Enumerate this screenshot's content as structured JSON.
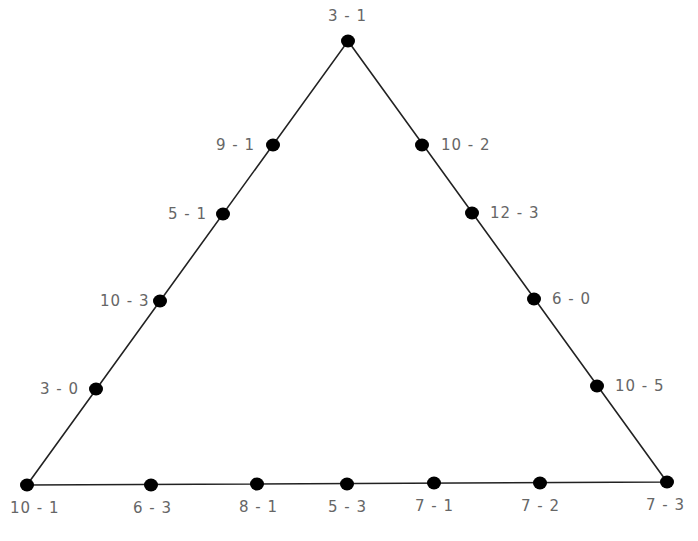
{
  "diagram": {
    "type": "triangle-dot-diagram",
    "line_color": "#222222",
    "dot_color": "#000000",
    "label_color": "#666666",
    "vertices": {
      "top": {
        "x": 348,
        "y": 41
      },
      "bottom_left": {
        "x": 27,
        "y": 485
      },
      "bottom_right": {
        "x": 667,
        "y": 482
      }
    },
    "nodes": [
      {
        "id": "n1",
        "label": "3 - 1",
        "x": 348,
        "y": 41,
        "lx": 328,
        "ly": 8
      },
      {
        "id": "n2",
        "label": "9 - 1",
        "x": 273,
        "y": 145,
        "lx": 216,
        "ly": 137
      },
      {
        "id": "n3",
        "label": "5 - 1",
        "x": 223,
        "y": 214,
        "lx": 168,
        "ly": 206
      },
      {
        "id": "n4",
        "label": "10 - 3",
        "x": 160,
        "y": 301,
        "lx": 100,
        "ly": 293
      },
      {
        "id": "n5",
        "label": "3 - 0",
        "x": 96,
        "y": 389,
        "lx": 40,
        "ly": 381
      },
      {
        "id": "n6",
        "label": "10 - 1",
        "x": 27,
        "y": 485,
        "lx": 10,
        "ly": 500
      },
      {
        "id": "n7",
        "label": "10 - 2",
        "x": 422,
        "y": 145,
        "lx": 441,
        "ly": 137
      },
      {
        "id": "n8",
        "label": "12 - 3",
        "x": 472,
        "y": 213,
        "lx": 490,
        "ly": 205
      },
      {
        "id": "n9",
        "label": "6 - 0",
        "x": 534,
        "y": 299,
        "lx": 552,
        "ly": 291
      },
      {
        "id": "n10",
        "label": "10 - 5",
        "x": 597,
        "y": 386,
        "lx": 615,
        "ly": 378
      },
      {
        "id": "n11",
        "label": "7 - 3",
        "x": 667,
        "y": 482,
        "lx": 646,
        "ly": 497
      },
      {
        "id": "n12",
        "label": "6 - 3",
        "x": 151,
        "y": 485,
        "lx": 133,
        "ly": 500
      },
      {
        "id": "n13",
        "label": "8 - 1",
        "x": 257,
        "y": 484,
        "lx": 239,
        "ly": 499
      },
      {
        "id": "n14",
        "label": "5 - 3",
        "x": 347,
        "y": 484,
        "lx": 328,
        "ly": 499
      },
      {
        "id": "n15",
        "label": "7 - 1",
        "x": 434,
        "y": 483,
        "lx": 415,
        "ly": 498
      },
      {
        "id": "n16",
        "label": "7 - 2",
        "x": 540,
        "y": 483,
        "lx": 521,
        "ly": 498
      }
    ]
  }
}
